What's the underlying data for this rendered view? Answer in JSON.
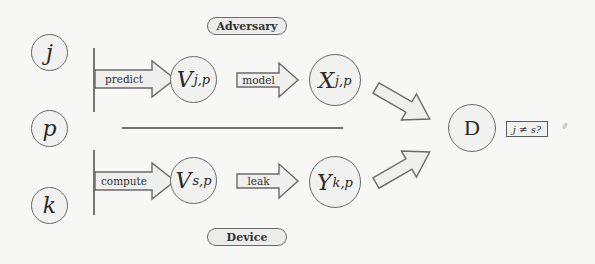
{
  "diagram": {
    "groups": {
      "adversary": "Adversary",
      "device": "Device"
    },
    "inputs": {
      "j": "j",
      "p": "p",
      "k": "k"
    },
    "nodes": {
      "v_jp": {
        "base": "V",
        "sub": "j,p"
      },
      "x_jp": {
        "base": "X",
        "sub": "j,p"
      },
      "v_sp": {
        "base": "V",
        "sub": "s,p"
      },
      "y_kp": {
        "base": "Y",
        "sub": "k,p"
      },
      "d": "D"
    },
    "arrows": {
      "predict": "predict",
      "model": "model",
      "compute": "compute",
      "leak": "leak"
    },
    "decision_label": "j ≠ s?",
    "colors": {
      "stroke": "#6a6a6a",
      "fill": "#f1f1ef",
      "arrow_fill": "#efefed",
      "background": "#f7f7f5"
    }
  }
}
